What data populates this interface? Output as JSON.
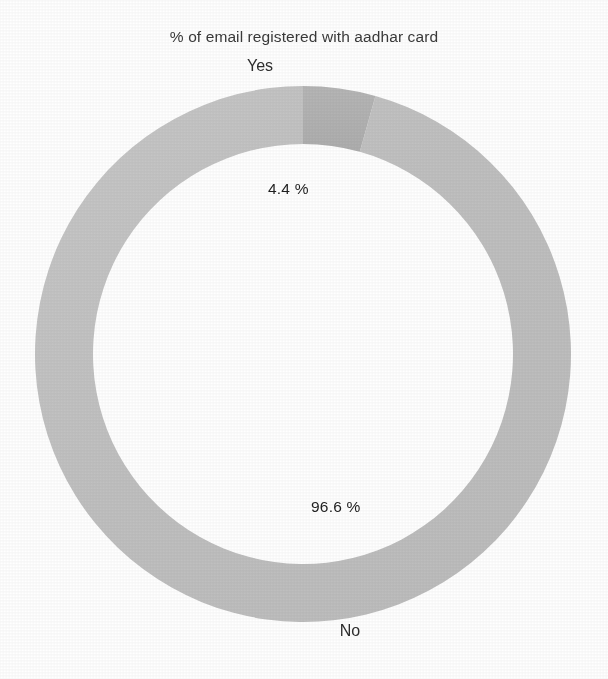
{
  "chart_data": {
    "type": "pie",
    "variant": "doughnut",
    "title": "% of email registered with aadhar card",
    "xlabel": "",
    "ylabel": "",
    "legend_position": "none",
    "grid": false,
    "unit": "%",
    "categories": [
      "Yes",
      "No"
    ],
    "values": [
      4.4,
      96.6
    ],
    "value_labels": [
      "4.4 %",
      "96.6 %"
    ],
    "category_labels": [
      "Yes",
      "No"
    ],
    "start_angle_deg": 0,
    "direction": "clockwise",
    "slices": [
      {
        "name": "Yes",
        "value": 4.4,
        "value_label": "4.4 %",
        "color": "#b3b3b3",
        "start_deg": 0,
        "end_deg": 15.84,
        "label_position": "inside-left",
        "category_label": "Yes"
      },
      {
        "name": "No",
        "value": 96.6,
        "value_label": "96.6 %",
        "color": "#c2c2c2",
        "start_deg": 15.84,
        "end_deg": 360,
        "label_position": "inside-right",
        "category_label": "No"
      }
    ],
    "geometry": {
      "center_x": 303,
      "center_y": 354,
      "outer_radius": 268,
      "inner_radius": 210
    }
  },
  "colors": {
    "background": "#ffffff",
    "title_text": "#3a3a3a",
    "label_text": "#2e2e2e",
    "value_text": "#1f1f1f",
    "slice_yes": "#b3b3b3",
    "slice_no": "#c2c2c2",
    "slice_edge": "#bdbdbd"
  }
}
